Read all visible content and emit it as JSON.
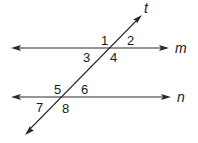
{
  "diagram": {
    "type": "parallel-lines-transversal",
    "lines": {
      "m": {
        "label": "m",
        "y": 48,
        "x1": 12,
        "x2": 168,
        "arrows": "both"
      },
      "n": {
        "label": "n",
        "y": 97,
        "x1": 12,
        "x2": 170,
        "arrows": "both"
      },
      "t": {
        "label": "t",
        "x1": 25,
        "y1": 135,
        "x2": 142,
        "y2": 15,
        "arrows": "both"
      }
    },
    "angles": [
      {
        "label": "1",
        "x": 101,
        "y": 45
      },
      {
        "label": "2",
        "x": 127,
        "y": 45
      },
      {
        "label": "3",
        "x": 83,
        "y": 62
      },
      {
        "label": "4",
        "x": 110,
        "y": 62
      },
      {
        "label": "5",
        "x": 54,
        "y": 94
      },
      {
        "label": "6",
        "x": 81,
        "y": 94
      },
      {
        "label": "7",
        "x": 36,
        "y": 112
      },
      {
        "label": "8",
        "x": 62,
        "y": 113
      }
    ],
    "line_labels": [
      {
        "label": "m",
        "x": 175,
        "y": 53
      },
      {
        "label": "n",
        "x": 177,
        "y": 102
      },
      {
        "label": "t",
        "x": 144,
        "y": 13
      }
    ]
  }
}
